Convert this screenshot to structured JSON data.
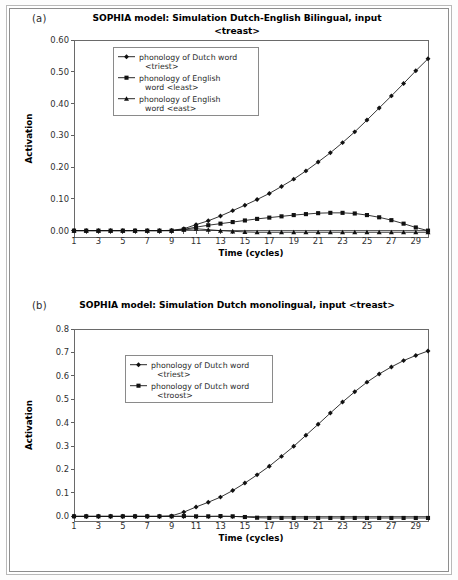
{
  "figure": {
    "background": "#ffffff",
    "border_color": "#8e8e8e"
  },
  "panels": [
    {
      "id": "a",
      "label": "(a)",
      "title": "SOPHIA model: Simulation Dutch-English Bilingual, input <treast>",
      "title_lines": [
        "SOPHIA model: Simulation Dutch-English Bilingual, input",
        "<treast>"
      ],
      "chart_data": {
        "type": "line",
        "title": "SOPHIA model: Simulation Dutch-English Bilingual, input <treast>",
        "xlabel": "Time (cycles)",
        "ylabel": "Activation",
        "xlim": [
          1,
          30
        ],
        "ylim": [
          -0.02,
          0.6
        ],
        "ytick_values": [
          0.0,
          0.1,
          0.2,
          0.3,
          0.4,
          0.5,
          0.6
        ],
        "ytick_labels": [
          "0.00",
          "0.10",
          "0.20",
          "0.30",
          "0.40",
          "0.50",
          "0.60"
        ],
        "xtick_values": [
          1,
          3,
          5,
          7,
          9,
          11,
          13,
          15,
          17,
          19,
          21,
          23,
          25,
          27,
          29
        ],
        "xtick_labels": [
          "1",
          "3",
          "5",
          "7",
          "9",
          "11",
          "13",
          "15",
          "17",
          "19",
          "21",
          "23",
          "25",
          "27",
          "29"
        ],
        "x": [
          1,
          2,
          3,
          4,
          5,
          6,
          7,
          8,
          9,
          10,
          11,
          12,
          13,
          14,
          15,
          16,
          17,
          18,
          19,
          20,
          21,
          22,
          23,
          24,
          25,
          26,
          27,
          28,
          29,
          30
        ],
        "grid": false,
        "legend_position": "upper-center",
        "series": [
          {
            "name": "phonology of Dutch word <triest>",
            "label_lines": [
              "phonology of Dutch word",
              "<triest>"
            ],
            "marker": "diamond",
            "color": "#111111",
            "values": [
              0.0,
              0.0,
              0.0,
              0.0,
              0.0,
              0.0,
              0.0,
              0.0,
              0.001,
              0.006,
              0.019,
              0.031,
              0.046,
              0.063,
              0.08,
              0.098,
              0.117,
              0.139,
              0.162,
              0.188,
              0.216,
              0.245,
              0.277,
              0.311,
              0.348,
              0.386,
              0.424,
              0.463,
              0.503,
              0.541
            ]
          },
          {
            "name": "phonology of English word <least>",
            "label_lines": [
              "phonology of English",
              "word <least>"
            ],
            "marker": "square",
            "color": "#111111",
            "values": [
              0.0,
              0.0,
              0.0,
              0.0,
              0.0,
              0.0,
              0.0,
              0.0,
              0.0,
              0.004,
              0.011,
              0.017,
              0.022,
              0.027,
              0.032,
              0.037,
              0.041,
              0.045,
              0.049,
              0.052,
              0.055,
              0.056,
              0.056,
              0.054,
              0.049,
              0.042,
              0.033,
              0.022,
              0.01,
              0.0
            ]
          },
          {
            "name": "phonology of English word <east>",
            "label_lines": [
              "phonology of English",
              "word <east>"
            ],
            "marker": "triangle",
            "color": "#111111",
            "values": [
              0.0,
              0.0,
              0.0,
              0.0,
              0.0,
              0.0,
              0.0,
              0.0,
              0.0,
              0.003,
              0.006,
              0.003,
              0.0,
              -0.002,
              -0.004,
              -0.005,
              -0.005,
              -0.005,
              -0.005,
              -0.005,
              -0.005,
              -0.005,
              -0.005,
              -0.005,
              -0.005,
              -0.005,
              -0.005,
              -0.005,
              -0.005,
              -0.005
            ]
          }
        ]
      }
    },
    {
      "id": "b",
      "label": "(b)",
      "title": "SOPHIA model: Simulation Dutch monolingual, input <treast>",
      "title_lines": [
        "SOPHIA model: Simulation Dutch monolingual, input <treast>"
      ],
      "chart_data": {
        "type": "line",
        "title": "SOPHIA model: Simulation Dutch monolingual, input <treast>",
        "xlabel": "Time (cycles)",
        "ylabel": "Activation",
        "xlim": [
          1,
          30
        ],
        "ylim": [
          -0.02,
          0.8
        ],
        "ytick_values": [
          0.0,
          0.1,
          0.2,
          0.3,
          0.4,
          0.5,
          0.6,
          0.7,
          0.8
        ],
        "ytick_labels": [
          "0.0",
          "0.1",
          "0.2",
          "0.3",
          "0.4",
          "0.5",
          "0.6",
          "0.7",
          "0.8"
        ],
        "xtick_values": [
          1,
          3,
          5,
          7,
          9,
          11,
          13,
          15,
          17,
          19,
          21,
          23,
          25,
          27,
          29
        ],
        "xtick_labels": [
          "1",
          "3",
          "5",
          "7",
          "9",
          "11",
          "13",
          "15",
          "17",
          "19",
          "21",
          "23",
          "25",
          "27",
          "29"
        ],
        "x": [
          1,
          2,
          3,
          4,
          5,
          6,
          7,
          8,
          9,
          10,
          11,
          12,
          13,
          14,
          15,
          16,
          17,
          18,
          19,
          20,
          21,
          22,
          23,
          24,
          25,
          26,
          27,
          28,
          29,
          30
        ],
        "grid": false,
        "legend_position": "upper-center",
        "series": [
          {
            "name": "phonology of Dutch word <triest>",
            "label_lines": [
              "phonology of Dutch word",
              "<triest>"
            ],
            "marker": "diamond",
            "color": "#111111",
            "values": [
              0.0,
              0.0,
              0.0,
              0.0,
              0.0,
              0.0,
              0.0,
              0.0,
              0.002,
              0.018,
              0.04,
              0.06,
              0.082,
              0.11,
              0.142,
              0.177,
              0.214,
              0.256,
              0.299,
              0.346,
              0.393,
              0.441,
              0.488,
              0.532,
              0.573,
              0.608,
              0.638,
              0.665,
              0.687,
              0.706
            ]
          },
          {
            "name": "phonology of Dutch word <troost>",
            "label_lines": [
              "phonology of Dutch word",
              "<troost>"
            ],
            "marker": "square",
            "color": "#111111",
            "values": [
              0.0,
              0.0,
              0.0,
              0.0,
              0.0,
              0.0,
              0.0,
              0.0,
              0.0,
              0.001,
              0.0,
              0.0,
              0.001,
              0.0,
              -0.003,
              -0.006,
              -0.007,
              -0.007,
              -0.007,
              -0.007,
              -0.007,
              -0.007,
              -0.007,
              -0.007,
              -0.007,
              -0.007,
              -0.007,
              -0.007,
              -0.007,
              -0.007
            ]
          }
        ]
      }
    }
  ]
}
